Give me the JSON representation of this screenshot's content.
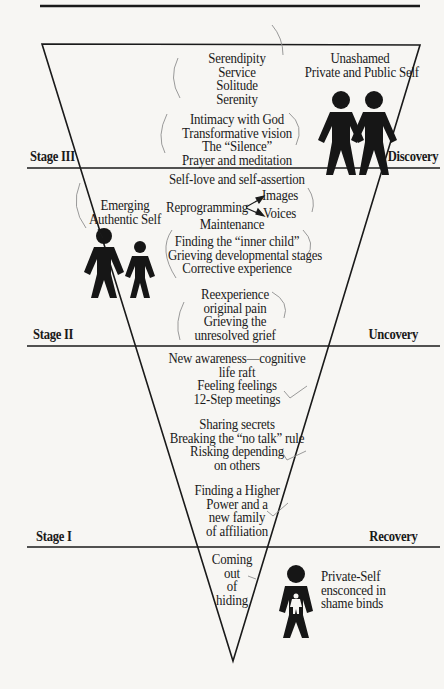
{
  "stages": [
    {
      "label": "Stage III",
      "phase": "Discovery"
    },
    {
      "label": "Stage II",
      "phase": "Uncovery"
    },
    {
      "label": "Stage I",
      "phase": "Recovery"
    }
  ],
  "stage3": {
    "group1": [
      "Serendipity",
      "Service",
      "Solitude",
      "Serenity"
    ],
    "group2": [
      "Intimacy with God",
      "Transformative vision",
      "The “Silence”",
      "Prayer and meditation"
    ],
    "figure_caption": [
      "Unashamed",
      "Private and Public Self"
    ]
  },
  "stage2": {
    "line1": "Self-love and self-assertion",
    "reprogramming": "Reprogramming",
    "branch_top": "Images",
    "branch_bottom": "Voices",
    "maintenance": "Maintenance",
    "group2": [
      "Finding the “inner child”",
      "Grieving developmental stages",
      "Corrective experience"
    ],
    "group3": [
      "Reexperience",
      "original pain",
      "Grieving the",
      "unresolved grief"
    ],
    "figure_caption": [
      "Emerging",
      "Authentic Self"
    ]
  },
  "stage1": {
    "group1": [
      "New awareness—cognitive",
      "life raft",
      "Feeling feelings",
      "12-Step meetings"
    ],
    "group2": [
      "Sharing secrets",
      "Breaking the “no talk” rule",
      "Risking depending",
      "on others"
    ],
    "group3": [
      "Finding a Higher",
      "Power and a",
      "new family",
      "of affiliation"
    ]
  },
  "bottom": {
    "text": [
      "Coming",
      "out",
      "of",
      "hiding"
    ],
    "figure_caption": [
      "Private-Self",
      "ensconced in",
      "shame binds"
    ]
  },
  "colors": {
    "ink": "#1a1a1a",
    "paper": "#f7f6f3",
    "pencil": "#8a8a8a"
  }
}
